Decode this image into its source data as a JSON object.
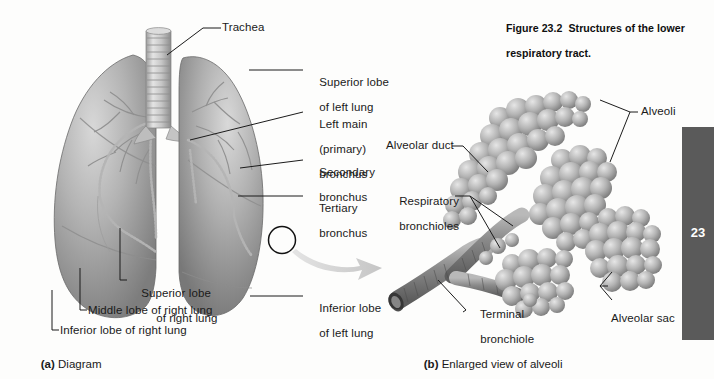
{
  "figure": {
    "caption_line1": "Figure 23.2  Structures of the lower",
    "caption_line2": "respiratory tract."
  },
  "chapter_tab": {
    "number": "23"
  },
  "panel_a": {
    "caption_prefix": "(a)",
    "caption_text": " Diagram",
    "labels": {
      "trachea": "Trachea",
      "superior_lobe_left_l1": "Superior lobe",
      "superior_lobe_left_l2": "of left lung",
      "left_main_l1": "Left main",
      "left_main_l2": "(primary)",
      "left_main_l3": "bronchus",
      "secondary_l1": "Secondary",
      "secondary_l2": "bronchus",
      "tertiary_l1": "Tertiary",
      "tertiary_l2": "bronchus",
      "inferior_lobe_left_l1": "Inferior lobe",
      "inferior_lobe_left_l2": "of left lung",
      "superior_lobe_right_l1": "Superior lobe",
      "superior_lobe_right_l2": "of right lung",
      "middle_lobe_right": "Middle lobe of right lung",
      "inferior_lobe_right": "Inferior lobe of right lung"
    }
  },
  "panel_b": {
    "caption_prefix": "(b)",
    "caption_text": " Enlarged view of alveoli",
    "labels": {
      "alveoli": "Alveoli",
      "alveolar_duct": "Alveolar duct",
      "respiratory_bronchioles_l1": "Respiratory",
      "respiratory_bronchioles_l2": "bronchioles",
      "terminal_bronchiole_l1": "Terminal",
      "terminal_bronchiole_l2": "bronchiole",
      "alveolar_sac": "Alveolar sac"
    }
  },
  "colors": {
    "page_background": "#fdfdfc",
    "tab_background": "#5a5a5a",
    "leader_line": "#1b1b1b",
    "tissue_light": "#cfcfcf",
    "tissue_mid": "#9a9a9a",
    "tissue_dark": "#6e6e6e",
    "zoom_arrow": "#cccccc"
  }
}
